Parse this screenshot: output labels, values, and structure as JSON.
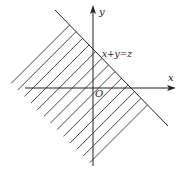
{
  "diagram": {
    "axes": {
      "x_label": "x",
      "y_label": "y",
      "origin_label": "O"
    },
    "line_label": "x+y=z",
    "shaded_region": "half-plane below line x+y=z (hatched)",
    "colors": {
      "stroke": "#222222",
      "background": "#ffffff"
    }
  }
}
